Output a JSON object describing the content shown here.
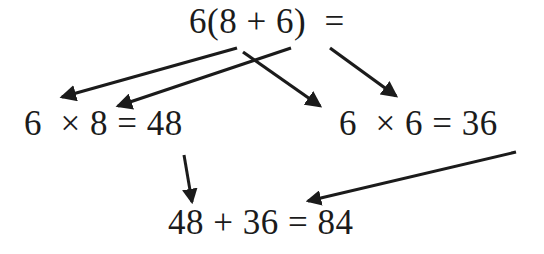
{
  "diagram": {
    "background_color": "#ffffff",
    "ink_color": "#1b1b1b",
    "nodes": {
      "top": {
        "text": "6(8 + 6)  =",
        "role": "original-expression"
      },
      "left": {
        "text": "6  × 8 = 48",
        "role": "first-partial-product"
      },
      "right": {
        "text": "6  × 6 = 36",
        "role": "second-partial-product"
      },
      "bottom": {
        "text": "48 + 36 = 84",
        "role": "final-sum"
      }
    },
    "arrows": [
      {
        "name": "arrow-6-to-left-product",
        "from": "top",
        "to": "left",
        "x1": 237,
        "y1": 48,
        "x2": 58,
        "y2": 99
      },
      {
        "name": "arrow-8-to-left-product",
        "from": "top",
        "to": "left",
        "x1": 291,
        "y1": 48,
        "x2": 113,
        "y2": 108
      },
      {
        "name": "arrow-6-to-right-product",
        "from": "top",
        "to": "right",
        "x1": 243,
        "y1": 52,
        "x2": 325,
        "y2": 110
      },
      {
        "name": "arrow-6-to-right-product-outer",
        "from": "top",
        "to": "right",
        "x1": 330,
        "y1": 48,
        "x2": 400,
        "y2": 99
      },
      {
        "name": "arrow-left-product-to-sum",
        "from": "left",
        "to": "bottom",
        "x1": 184,
        "y1": 155,
        "x2": 193,
        "y2": 206
      },
      {
        "name": "arrow-right-product-to-sum",
        "from": "right",
        "to": "bottom",
        "x1": 516,
        "y1": 152,
        "x2": 303,
        "y2": 203
      }
    ]
  }
}
